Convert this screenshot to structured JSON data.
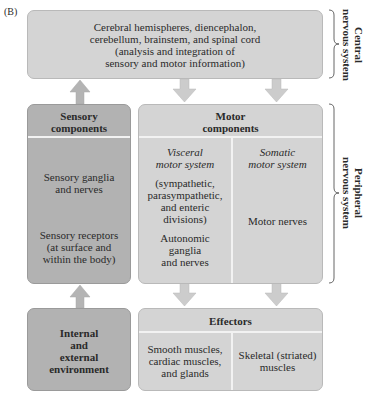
{
  "figure_label": "(B)",
  "cns_box": {
    "line1": "Cerebral hemispheres, diencephalon,",
    "line2": "cerebellum, brainstem, and spinal cord",
    "line3": "(analysis and integration of",
    "line4": "sensory and motor information)"
  },
  "sensory_components": {
    "title_line1": "Sensory",
    "title_line2": "components",
    "ganglia_line1": "Sensory ganglia",
    "ganglia_line2": "and nerves",
    "receptors_line1": "Sensory receptors",
    "receptors_line2": "(at surface and",
    "receptors_line3": "within the body)"
  },
  "motor_components": {
    "title_line1": "Motor",
    "title_line2": "components",
    "visceral": {
      "title_line1": "Visceral",
      "title_line2": "motor system",
      "desc_line1": "(sympathetic,",
      "desc_line2": "parasympathetic,",
      "desc_line3": "and enteric",
      "desc_line4": "divisions)",
      "ganglia_line1": "Autonomic",
      "ganglia_line2": "ganglia",
      "ganglia_line3": "and nerves"
    },
    "somatic": {
      "title_line1": "Somatic",
      "title_line2": "motor system",
      "nerves": "Motor nerves"
    }
  },
  "environment": {
    "line1": "Internal",
    "line2": "and",
    "line3": "external",
    "line4": "environment"
  },
  "effectors": {
    "title": "Effectors",
    "smooth_line1": "Smooth muscles,",
    "smooth_line2": "cardiac muscles,",
    "smooth_line3": "and glands",
    "skeletal_line1": "Skeletal (striated)",
    "skeletal_line2": "muscles"
  },
  "brackets": {
    "central_line1": "Central",
    "central_line2": "nervous system",
    "peripheral_line1": "Peripheral",
    "peripheral_line2": "nervous system"
  },
  "colors": {
    "light_box": "#d4d4d4",
    "dark_box": "#b2b2b2",
    "arrow": "#c8c8c8",
    "divider": "#f2f2f2"
  }
}
